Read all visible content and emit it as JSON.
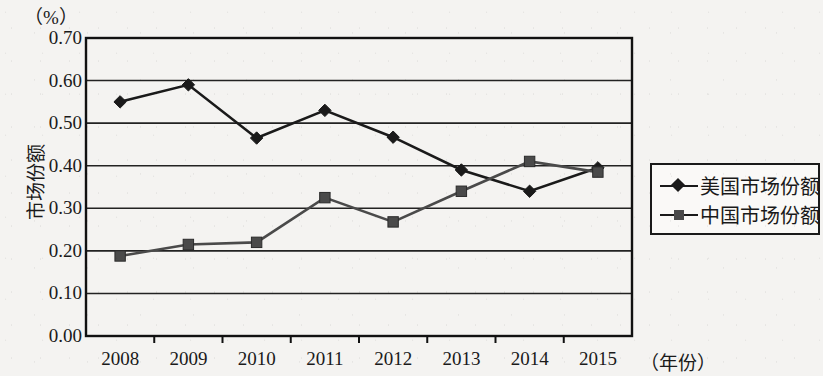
{
  "chart_data": {
    "type": "line",
    "title": "",
    "unit_label": "（%）",
    "ylabel": "市场份额",
    "xlabel": "（年份）",
    "categories": [
      "2008",
      "2009",
      "2010",
      "2011",
      "2012",
      "2013",
      "2014",
      "2015"
    ],
    "ylim": [
      0.0,
      0.7
    ],
    "ytick_labels": [
      "0.70",
      "0.60",
      "0.50",
      "0.40",
      "0.30",
      "0.20",
      "0.10",
      "0.00"
    ],
    "ytick_values": [
      0.7,
      0.6,
      0.5,
      0.4,
      0.3,
      0.2,
      0.1,
      0.0
    ],
    "grid": true,
    "legend_position": "right",
    "series": [
      {
        "name": "美国市场份额",
        "marker": "diamond",
        "color": "#1a1a1a",
        "values": [
          0.55,
          0.59,
          0.465,
          0.53,
          0.467,
          0.39,
          0.34,
          0.395
        ]
      },
      {
        "name": "中国市场份额",
        "marker": "square",
        "color": "#4a4a4a",
        "values": [
          0.188,
          0.215,
          0.22,
          0.325,
          0.268,
          0.34,
          0.41,
          0.385
        ]
      }
    ]
  }
}
